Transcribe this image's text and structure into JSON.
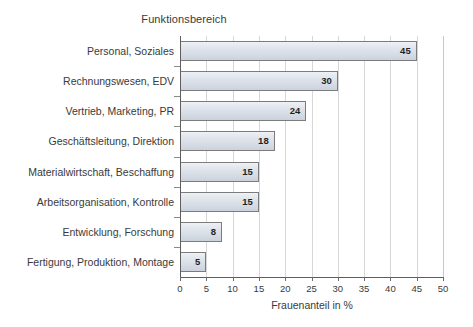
{
  "chart_data": {
    "type": "bar",
    "orientation": "horizontal",
    "title": "Funktionsbereich",
    "xlabel": "Frauenanteil in %",
    "ylabel": "Funktionsbereich",
    "xlim": [
      0,
      50
    ],
    "xticks": [
      0,
      5,
      10,
      15,
      20,
      25,
      30,
      35,
      40,
      45,
      50
    ],
    "grid": "vertical",
    "legend": "none",
    "categories": [
      "Personal, Soziales",
      "Rechnungswesen, EDV",
      "Vertrieb, Marketing, PR",
      "Geschäftsleitung, Direktion",
      "Materialwirtschaft, Beschaffung",
      "Arbeitsorganisation, Kontrolle",
      "Entwicklung, Forschung",
      "Fertigung, Produktion, Montage"
    ],
    "values": [
      45,
      30,
      24,
      18,
      15,
      15,
      8,
      5
    ],
    "data_labels": [
      "45",
      "30",
      "24",
      "18",
      "15",
      "15",
      "8",
      "5"
    ],
    "colors": {
      "bar_fill": "#dce1e9",
      "bar_border": "#7c7c7c",
      "gridline": "#d6d6d6",
      "axis_line": "#5f5f5f",
      "text": "#3a3a3a",
      "data_label": "#1f1f1f",
      "background": "#ffffff"
    }
  }
}
